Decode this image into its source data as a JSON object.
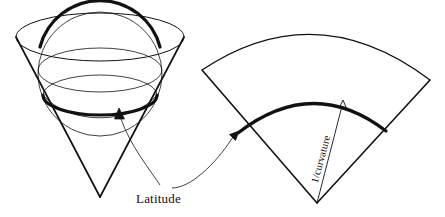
{
  "figure": {
    "title": "",
    "background_color": "#ffffff",
    "stroke_color": "#111111",
    "labels": {
      "latitude": "Latitude",
      "radius_of_curvature": "1/curvature"
    },
    "left_panel": {
      "name": "cone-tangent-to-sphere",
      "elements": [
        "cone",
        "sphere",
        "sphere-equator-ellipse",
        "latitude-circle",
        "cone-top-ellipse",
        "sphere-great-circle-arc"
      ],
      "cone_apex": {
        "x": 100,
        "y": 197
      },
      "cone_top_ellipse": {
        "cx": 100,
        "cy": 37,
        "rx": 84,
        "ry": 24
      },
      "sphere": {
        "cx": 100,
        "cy": 74,
        "r": 62
      },
      "latitude_ellipse": {
        "cx": 100,
        "cy": 95,
        "rx": 57,
        "ry": 20
      },
      "equator_ellipse": {
        "cx": 100,
        "cy": 70,
        "rx": 62,
        "ry": 22
      }
    },
    "right_panel": {
      "name": "unrolled-cone-sector",
      "elements": [
        "sector-outer-arc",
        "sector-left-edge",
        "sector-right-edge",
        "latitude-arc",
        "curvature-radius-arrow"
      ],
      "sector_apex": {
        "x": 317,
        "y": 203
      },
      "outer_arc_left": {
        "x": 202,
        "y": 70
      },
      "outer_arc_right": {
        "x": 430,
        "y": 80
      },
      "latitude_arc_left": {
        "x": 238,
        "y": 133
      },
      "latitude_arc_right": {
        "x": 386,
        "y": 131
      }
    },
    "annotations": [
      {
        "name": "latitude-arrow-to-cone",
        "from": {
          "x": 186,
          "y": 186
        },
        "to": {
          "x": 120,
          "y": 114
        }
      },
      {
        "name": "latitude-arrow-to-sector",
        "from": {
          "x": 186,
          "y": 186
        },
        "to": {
          "x": 238,
          "y": 133
        }
      },
      {
        "name": "curvature-arrow",
        "from": {
          "x": 317,
          "y": 203
        },
        "to": {
          "x": 343,
          "y": 103
        }
      }
    ]
  }
}
